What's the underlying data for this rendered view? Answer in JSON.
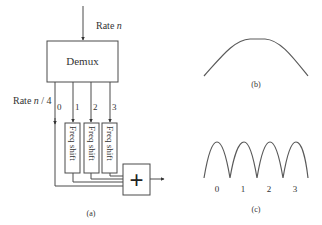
{
  "panel_a": {
    "input_label_prefix": "Rate ",
    "input_label_var": "n",
    "demux_label": "Demux",
    "output_rate_prefix": "Rate ",
    "output_rate_var": "n",
    "output_rate_suffix": " / 4",
    "channels": [
      "0",
      "1",
      "2",
      "3"
    ],
    "freq_shift_label": "Freq shift",
    "adder_symbol": "+",
    "caption": "(a)"
  },
  "panel_b": {
    "caption": "(b)"
  },
  "panel_c": {
    "bump_labels": [
      "0",
      "1",
      "2",
      "3"
    ],
    "caption": "(c)"
  }
}
